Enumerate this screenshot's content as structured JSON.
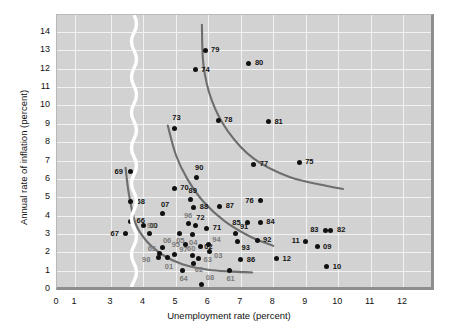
{
  "chart_data": {
    "type": "scatter",
    "title": "",
    "xlabel": "Unemployment rate (percent)",
    "ylabel": "Annual rate of inflation (percent)",
    "xlim": [
      0,
      12.8
    ],
    "ylim": [
      0,
      14.6
    ],
    "xticks": [
      0,
      1,
      3,
      4,
      5,
      6,
      7,
      8,
      9,
      10,
      11,
      12
    ],
    "yticks": [
      0,
      1,
      2,
      3,
      4,
      5,
      6,
      7,
      8,
      9,
      10,
      11,
      12,
      13,
      14
    ],
    "grid": true,
    "legend": null,
    "axis_break": {
      "after": 1,
      "before": 3,
      "style": "wavy-white-ribbon"
    },
    "point_color": "#111111",
    "curve_color": "#6e6e6e",
    "panel_color": "#d2d2d2",
    "grid_color": "#f2f2f2",
    "points": [
      {
        "label": "79",
        "x": 5.9,
        "y": 13.0,
        "lx": 6,
        "ly": -4
      },
      {
        "label": "74",
        "x": 5.6,
        "y": 11.95,
        "lx": 6,
        "ly": -4
      },
      {
        "label": "80",
        "x": 7.25,
        "y": 12.3,
        "lx": 6,
        "ly": -4
      },
      {
        "label": "73",
        "x": 4.95,
        "y": 8.75,
        "lx": -2,
        "ly": -14
      },
      {
        "label": "78",
        "x": 6.3,
        "y": 9.2,
        "lx": 6,
        "ly": -4
      },
      {
        "label": "81",
        "x": 7.85,
        "y": 9.1,
        "lx": 6,
        "ly": -4
      },
      {
        "label": "77",
        "x": 7.4,
        "y": 6.8,
        "lx": 6,
        "ly": -4
      },
      {
        "label": "75",
        "x": 8.8,
        "y": 6.9,
        "lx": 6,
        "ly": -4
      },
      {
        "label": "69",
        "x": 3.6,
        "y": 6.4,
        "lx": -16,
        "ly": -4
      },
      {
        "label": "90",
        "x": 5.65,
        "y": 6.05,
        "lx": -2,
        "ly": -14
      },
      {
        "label": "70",
        "x": 4.95,
        "y": 5.5,
        "lx": 6,
        "ly": -4
      },
      {
        "label": "68",
        "x": 3.6,
        "y": 4.75,
        "lx": 6,
        "ly": -4
      },
      {
        "label": "89",
        "x": 5.45,
        "y": 4.85,
        "lx": -2,
        "ly": -13
      },
      {
        "label": "88",
        "x": 5.55,
        "y": 4.45,
        "lx": 6,
        "ly": -4
      },
      {
        "label": "87",
        "x": 6.35,
        "y": 4.5,
        "lx": 6,
        "ly": -4
      },
      {
        "label": "07",
        "x": 4.6,
        "y": 4.1,
        "lx": -2,
        "ly": -13
      },
      {
        "label": "76",
        "x": 7.6,
        "y": 4.8,
        "lx": -15,
        "ly": -4
      },
      {
        "label": "66",
        "x": 3.6,
        "y": 3.7,
        "lx": 6,
        "ly": -4
      },
      {
        "label": "00",
        "x": 4.0,
        "y": 3.45,
        "lx": 6,
        "ly": -4
      },
      {
        "label": "96",
        "x": 5.4,
        "y": 3.55,
        "lx": -5,
        "ly": -12
      },
      {
        "label": "72",
        "x": 5.6,
        "y": 3.45,
        "lx": 1,
        "ly": -12
      },
      {
        "label": "71",
        "x": 5.95,
        "y": 3.3,
        "lx": 6,
        "ly": -4
      },
      {
        "label": "85",
        "x": 7.2,
        "y": 3.6,
        "lx": -15,
        "ly": -4
      },
      {
        "label": "84",
        "x": 7.6,
        "y": 3.65,
        "lx": 6,
        "ly": -4
      },
      {
        "label": "83",
        "x": 9.6,
        "y": 3.2,
        "lx": -15,
        "ly": -4
      },
      {
        "label": "82",
        "x": 9.75,
        "y": 3.2,
        "lx": 7,
        "ly": -4
      },
      {
        "label": "67",
        "x": 3.45,
        "y": 3.0,
        "lx": -15,
        "ly": -4
      },
      {
        "label": "99",
        "x": 4.2,
        "y": 3.0,
        "lx": -3,
        "ly": -12
      },
      {
        "label": "05",
        "x": 5.1,
        "y": 3.05,
        "lx": -3,
        "ly": 4
      },
      {
        "label": "04",
        "x": 5.5,
        "y": 2.95,
        "lx": -3,
        "ly": 4
      },
      {
        "label": "91",
        "x": 6.85,
        "y": 3.0,
        "lx": 4,
        "ly": -11
      },
      {
        "label": "92",
        "x": 7.5,
        "y": 2.65,
        "lx": 6,
        "ly": -4
      },
      {
        "label": "93",
        "x": 6.9,
        "y": 2.6,
        "lx": 4,
        "ly": 3
      },
      {
        "label": "95",
        "x": 5.3,
        "y": 2.4,
        "lx": -14,
        "ly": -4
      },
      {
        "label": "02",
        "x": 5.75,
        "y": 2.3,
        "lx": 4,
        "ly": -4
      },
      {
        "label": "94",
        "x": 6.0,
        "y": 2.4,
        "lx": 4,
        "ly": -9
      },
      {
        "label": "03",
        "x": 6.05,
        "y": 2.05,
        "lx": 4,
        "ly": 1
      },
      {
        "label": "11",
        "x": 9.0,
        "y": 2.6,
        "lx": -14,
        "ly": -4
      },
      {
        "label": "09",
        "x": 9.35,
        "y": 2.3,
        "lx": 6,
        "ly": -4
      },
      {
        "label": "06",
        "x": 4.6,
        "y": 2.25,
        "lx": 0,
        "ly": -11
      },
      {
        "label": "65",
        "x": 4.5,
        "y": 1.95,
        "lx": -12,
        "ly": -8
      },
      {
        "label": "97",
        "x": 4.95,
        "y": 1.9,
        "lx": 5,
        "ly": -8
      },
      {
        "label": "60",
        "x": 5.5,
        "y": 1.85,
        "lx": -5,
        "ly": -10
      },
      {
        "label": "63",
        "x": 5.7,
        "y": 1.65,
        "lx": 5,
        "ly": -3
      },
      {
        "label": "98",
        "x": 4.45,
        "y": 1.7,
        "lx": -16,
        "ly": -2
      },
      {
        "label": "01",
        "x": 4.75,
        "y": 1.7,
        "lx": -3,
        "ly": 5
      },
      {
        "label": "62",
        "x": 5.55,
        "y": 1.4,
        "lx": 1,
        "ly": 3
      },
      {
        "label": "86",
        "x": 7.0,
        "y": 1.6,
        "lx": 6,
        "ly": -4
      },
      {
        "label": "12",
        "x": 8.1,
        "y": 1.65,
        "lx": 6,
        "ly": -4
      },
      {
        "label": "10",
        "x": 9.65,
        "y": 1.2,
        "lx": 6,
        "ly": -4
      },
      {
        "label": "64",
        "x": 5.2,
        "y": 1.0,
        "lx": -3,
        "ly": 4
      },
      {
        "label": "08",
        "x": 5.8,
        "y": 0.25,
        "lx": 4,
        "ly": -10
      },
      {
        "label": "61",
        "x": 6.65,
        "y": 1.0,
        "lx": -3,
        "ly": 4
      }
    ],
    "curves": [
      {
        "name": "phillips-curve-1960s",
        "points": [
          [
            3.45,
            6.6
          ],
          [
            3.55,
            5.2
          ],
          [
            3.75,
            3.6
          ],
          [
            4.1,
            2.6
          ],
          [
            4.6,
            1.85
          ],
          [
            5.2,
            1.35
          ],
          [
            6.0,
            1.05
          ],
          [
            6.75,
            0.95
          ],
          [
            7.35,
            0.9
          ]
        ]
      },
      {
        "name": "phillips-curve-1970s",
        "points": [
          [
            4.75,
            8.9
          ],
          [
            5.0,
            7.3
          ],
          [
            5.35,
            6.0
          ],
          [
            5.85,
            4.75
          ],
          [
            6.5,
            3.7
          ],
          [
            7.3,
            2.85
          ],
          [
            8.0,
            2.35
          ]
        ]
      },
      {
        "name": "phillips-curve-1980s",
        "points": [
          [
            5.8,
            14.4
          ],
          [
            5.85,
            12.2
          ],
          [
            6.1,
            10.3
          ],
          [
            6.6,
            8.6
          ],
          [
            7.4,
            7.1
          ],
          [
            8.5,
            6.1
          ],
          [
            9.7,
            5.6
          ],
          [
            10.15,
            5.45
          ]
        ]
      }
    ]
  },
  "axis": {
    "x_tick_labels": [
      "0",
      "1",
      "3",
      "4",
      "5",
      "6",
      "7",
      "8",
      "9",
      "10",
      "11",
      "12"
    ],
    "y_tick_labels": [
      "0",
      "1",
      "2",
      "3",
      "4",
      "5",
      "6",
      "7",
      "8",
      "9",
      "10",
      "11",
      "12",
      "13",
      "14"
    ],
    "x_title": "Unemployment rate (percent)",
    "y_title": "Annual rate of inflation (percent)"
  }
}
